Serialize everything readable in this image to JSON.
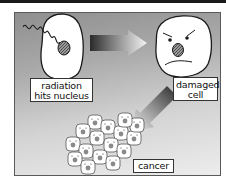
{
  "diagram": {
    "topic": "radiation-induced cancer",
    "stages": [
      {
        "id": "radiation",
        "label_lines": [
          "radiation",
          "hits nucleus"
        ]
      },
      {
        "id": "damaged",
        "label_lines": [
          "damaged",
          "cell"
        ]
      },
      {
        "id": "cancer",
        "label_lines": [
          "cancer"
        ]
      }
    ],
    "arrows": [
      {
        "from": "radiation",
        "to": "damaged",
        "direction": "right"
      },
      {
        "from": "damaged",
        "to": "cancer",
        "direction": "down-left"
      }
    ],
    "cancer_cell_count": 16
  },
  "colors": {
    "panel_dark": "#8f8f8f",
    "panel_light": "#ededed",
    "cell_fill": "#ffffff",
    "outline": "#1a1a1a",
    "nucleus": "#6e6e6e"
  }
}
